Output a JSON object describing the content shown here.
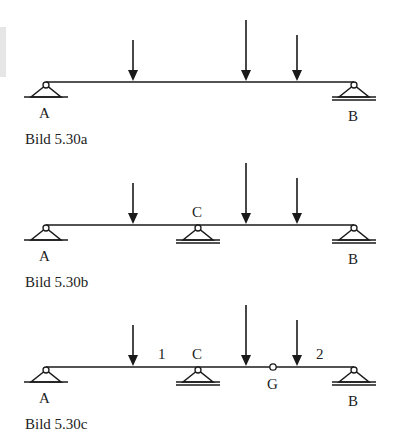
{
  "diagrams": [
    {
      "id": "a",
      "caption": "Bild 5.30a",
      "beam_y": 82,
      "beam_x1": 46,
      "beam_x2": 354,
      "supports": [
        {
          "label": "A",
          "x": 46,
          "type": "fixed-pin"
        },
        {
          "label": "B",
          "x": 354,
          "type": "roller"
        }
      ],
      "loads": [
        {
          "x": 133,
          "top": 40
        },
        {
          "x": 246,
          "top": 20
        },
        {
          "x": 297,
          "top": 35
        }
      ],
      "hinges": [],
      "span_labels": []
    },
    {
      "id": "b",
      "caption": "Bild 5.30b",
      "beam_y": 225,
      "beam_x1": 46,
      "beam_x2": 354,
      "supports": [
        {
          "label": "A",
          "x": 46,
          "type": "fixed-pin"
        },
        {
          "label": "C",
          "x": 198,
          "type": "roller"
        },
        {
          "label": "B",
          "x": 354,
          "type": "roller"
        }
      ],
      "loads": [
        {
          "x": 133,
          "top": 183
        },
        {
          "x": 246,
          "top": 163
        },
        {
          "x": 297,
          "top": 178
        }
      ],
      "hinges": [],
      "span_labels": []
    },
    {
      "id": "c",
      "caption": "Bild 5.30c",
      "beam_y": 367,
      "beam_x1": 46,
      "beam_x2": 354,
      "supports": [
        {
          "label": "A",
          "x": 46,
          "type": "fixed-pin"
        },
        {
          "label": "C",
          "x": 198,
          "type": "roller"
        },
        {
          "label": "B",
          "x": 354,
          "type": "roller"
        }
      ],
      "loads": [
        {
          "x": 133,
          "top": 325
        },
        {
          "x": 246,
          "top": 305
        },
        {
          "x": 297,
          "top": 320
        }
      ],
      "hinges": [
        {
          "label": "G",
          "x": 273
        }
      ],
      "span_labels": [
        {
          "text": "1",
          "x": 162
        },
        {
          "text": "2",
          "x": 320
        }
      ]
    }
  ]
}
